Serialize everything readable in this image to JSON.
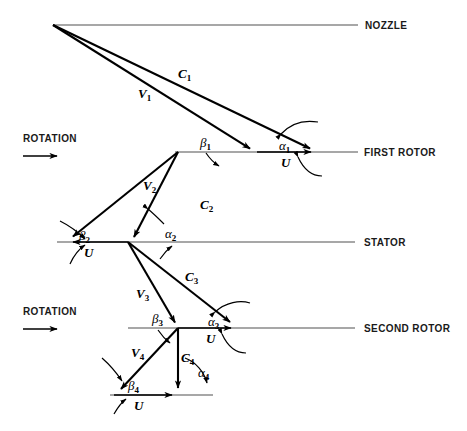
{
  "figure": {
    "background_color": "#ffffff",
    "line_color": "#000000",
    "axis_color": "#8a8a8a"
  },
  "stations": [
    {
      "id": "nozzle",
      "label": "NOZZLE",
      "line_y": 25,
      "line_x_start": 53,
      "line_x_end": 358,
      "label_x": 365,
      "label_y": 29
    },
    {
      "id": "first-rotor",
      "label": "FIRST ROTOR",
      "line_y": 152,
      "line_x_start": 175,
      "line_x_end": 358,
      "label_x": 364,
      "label_y": 156
    },
    {
      "id": "stator",
      "label": "STATOR",
      "line_y": 242,
      "line_x_start": 57,
      "line_x_end": 355,
      "label_x": 364,
      "label_y": 246
    },
    {
      "id": "second-rotor",
      "label": "SECOND ROTOR",
      "line_y": 328,
      "line_x_start": 128,
      "line_x_end": 355,
      "label_x": 364,
      "label_y": 332
    },
    {
      "id": "exit",
      "label": "",
      "line_y": 395,
      "line_x_start": 110,
      "line_x_end": 213,
      "label_x": 0,
      "label_y": 0
    }
  ],
  "rotation_markers": [
    {
      "id": "rotation-first-rotor",
      "label": "ROTATION",
      "label_x": 23,
      "label_y": 142,
      "arrow_y": 156,
      "arrow_x_start": 23,
      "arrow_x_end": 62
    },
    {
      "id": "rotation-second-rotor",
      "label": "ROTATION",
      "label_x": 23,
      "label_y": 315,
      "arrow_y": 329,
      "arrow_x_start": 23,
      "arrow_x_end": 62
    }
  ],
  "vectors": [
    {
      "id": "c1",
      "symbol": "C",
      "subscript": "1",
      "label_x": 178,
      "label_y": 78,
      "from_x": 53,
      "from_y": 25,
      "to_x": 318,
      "to_y": 152,
      "description": "absolute velocity leaving nozzle"
    },
    {
      "id": "v1",
      "symbol": "V",
      "subscript": "1",
      "label_x": 138,
      "label_y": 98,
      "from_x": 53,
      "from_y": 25,
      "to_x": 257,
      "to_y": 152,
      "description": "relative velocity entering first rotor"
    },
    {
      "id": "v2",
      "symbol": "V",
      "subscript": "2",
      "label_x": 143,
      "label_y": 190,
      "from_x": 178,
      "from_y": 152,
      "to_x": 66,
      "to_y": 242,
      "description": "relative velocity leaving first rotor"
    },
    {
      "id": "c2",
      "symbol": "C",
      "subscript": "2",
      "label_x": 200,
      "label_y": 209,
      "from_x": 178,
      "from_y": 152,
      "to_x": 128,
      "to_y": 242,
      "description": "absolute velocity leaving first rotor"
    },
    {
      "id": "c3",
      "symbol": "C",
      "subscript": "3",
      "label_x": 185,
      "label_y": 281,
      "from_x": 128,
      "from_y": 242,
      "to_x": 238,
      "to_y": 328,
      "description": "absolute velocity leaving stator"
    },
    {
      "id": "v3",
      "symbol": "V",
      "subscript": "3",
      "label_x": 136,
      "label_y": 298,
      "from_x": 128,
      "from_y": 242,
      "to_x": 178,
      "to_y": 328,
      "description": "relative velocity entering second rotor"
    },
    {
      "id": "v4",
      "symbol": "V",
      "subscript": "4",
      "label_x": 131,
      "label_y": 357,
      "from_x": 178,
      "from_y": 328,
      "to_x": 114,
      "to_y": 395,
      "description": "relative velocity leaving second rotor"
    },
    {
      "id": "c4",
      "symbol": "C",
      "subscript": "4",
      "label_x": 181,
      "label_y": 362,
      "from_x": 178,
      "from_y": 328,
      "to_x": 178,
      "to_y": 395,
      "description": "absolute velocity leaving second rotor"
    }
  ],
  "blade_speed_vectors": [
    {
      "id": "u1",
      "symbol": "U",
      "label_x": 281,
      "label_y": 167,
      "from_x": 257,
      "from_y": 152,
      "to_x": 318,
      "to_y": 152
    },
    {
      "id": "u2",
      "symbol": "U",
      "label_x": 84,
      "label_y": 257,
      "from_x": 66,
      "from_y": 242,
      "to_x": 128,
      "to_y": 242
    },
    {
      "id": "u3",
      "symbol": "U",
      "label_x": 206,
      "label_y": 343,
      "from_x": 178,
      "from_y": 328,
      "to_x": 238,
      "to_y": 328
    },
    {
      "id": "u4",
      "symbol": "U",
      "label_x": 134,
      "label_y": 410,
      "from_x": 114,
      "from_y": 395,
      "to_x": 178,
      "to_y": 395
    }
  ],
  "angles": [
    {
      "id": "alpha1",
      "symbol": "α",
      "subscript": "1",
      "label_x": 279,
      "label_y": 150,
      "type": "alpha"
    },
    {
      "id": "beta1",
      "symbol": "β",
      "subscript": "1",
      "label_x": 200,
      "label_y": 147,
      "type": "beta"
    },
    {
      "id": "alpha2",
      "symbol": "α",
      "subscript": "2",
      "label_x": 165,
      "label_y": 238,
      "type": "alpha"
    },
    {
      "id": "beta2",
      "symbol": "β",
      "subscript": "2",
      "label_x": 79,
      "label_y": 240,
      "type": "beta"
    },
    {
      "id": "alpha3",
      "symbol": "α",
      "subscript": "3",
      "label_x": 208,
      "label_y": 326,
      "type": "alpha"
    },
    {
      "id": "beta3",
      "symbol": "β",
      "subscript": "3",
      "label_x": 152,
      "label_y": 323,
      "type": "beta"
    },
    {
      "id": "alpha4",
      "symbol": "α",
      "subscript": "4",
      "label_x": 198,
      "label_y": 377,
      "type": "alpha"
    },
    {
      "id": "beta4",
      "symbol": "β",
      "subscript": "4",
      "label_x": 128,
      "label_y": 390,
      "type": "beta"
    }
  ]
}
